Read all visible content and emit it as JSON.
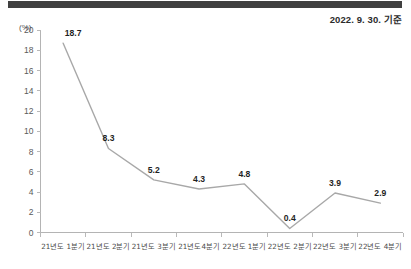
{
  "header": {
    "date_caption": "2022. 9. 30. 기준"
  },
  "chart_data": {
    "type": "line",
    "title": "",
    "subtitle": "",
    "xlabel": "",
    "ylabel": "",
    "unit_label": "(%)",
    "categories": [
      "21년도 1분기",
      "21년도 2분기",
      "21년도 3분기",
      "21년도4분기",
      "22년도 1분기",
      "22년도 2분기",
      "22년도 3분기",
      "22년도 4분기"
    ],
    "values": [
      18.7,
      8.3,
      5.2,
      4.3,
      4.8,
      0.4,
      3.9,
      2.9
    ],
    "point_labels": [
      "18.7",
      "8.3",
      "5.2",
      "4.3",
      "4.8",
      "0.4",
      "3.9",
      "2.9"
    ],
    "ylim": [
      0,
      20
    ],
    "ytick_step": 2,
    "ytick_labels": [
      "0",
      "2",
      "4",
      "6",
      "8",
      "10",
      "12",
      "14",
      "16",
      "18",
      "20"
    ],
    "grid": false,
    "legend": false,
    "line_color": "#a8a8a8",
    "axis_color": "#b4b4b4",
    "label_color": "#1f1f1f"
  },
  "decor": {
    "top_bar_color": "#404040"
  }
}
